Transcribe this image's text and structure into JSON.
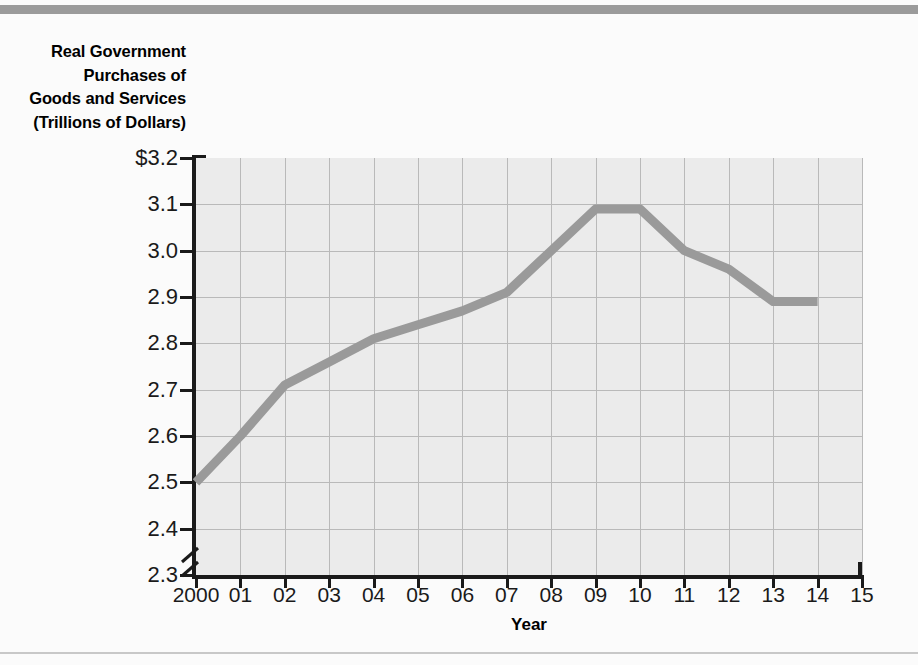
{
  "figure": {
    "background_color": "#fbfbfb",
    "top_band_color": "#9b9b9b",
    "bottom_rule_color": "#c8c8c8"
  },
  "title_lines": [
    "Real Government",
    "Purchases of",
    "Goods and Services",
    "(Trillions of Dollars)"
  ],
  "axis": {
    "x_title": "Year",
    "y_tick_labels": [
      "$3.2",
      "3.1",
      "3.0",
      "2.9",
      "2.8",
      "2.7",
      "2.6",
      "2.5",
      "2.4",
      "2.3"
    ],
    "x_tick_labels": [
      "2000",
      "01",
      "02",
      "03",
      "04",
      "05",
      "06",
      "07",
      "08",
      "09",
      "10",
      "11",
      "12",
      "13",
      "14",
      "15"
    ],
    "break_symbol": "axis-break"
  },
  "chart_data": {
    "type": "line",
    "title": "Real Government Purchases of Goods and Services (Trillions of Dollars)",
    "xlabel": "Year",
    "ylabel": "Real Government Purchases of Goods and Services (Trillions of Dollars)",
    "x": [
      "2000",
      "01",
      "02",
      "03",
      "04",
      "05",
      "06",
      "07",
      "08",
      "09",
      "10",
      "11",
      "12",
      "13",
      "14",
      "15"
    ],
    "categories": [
      "2000",
      "2001",
      "2002",
      "2003",
      "2004",
      "2005",
      "2006",
      "2007",
      "2008",
      "2009",
      "2010",
      "2011",
      "2012",
      "2013",
      "2014",
      "2015"
    ],
    "series": [
      {
        "name": "Real Government Purchases of Goods and Services",
        "color": "#9a9a9a",
        "values": [
          2.5,
          2.6,
          2.71,
          2.76,
          2.81,
          2.84,
          2.87,
          2.91,
          3.0,
          3.09,
          3.09,
          3.0,
          2.96,
          2.89,
          2.89,
          null
        ]
      }
    ],
    "ylim": [
      2.3,
      3.2
    ],
    "ytick_values": [
      3.2,
      3.1,
      3.0,
      2.9,
      2.8,
      2.7,
      2.6,
      2.5,
      2.4,
      2.3
    ],
    "y_axis_broken_below": 2.3,
    "units": "Trillions of Dollars",
    "grid": true,
    "legend": "none",
    "plot_background": "#ebebeb",
    "gridline_color": "#b9b9b9"
  }
}
